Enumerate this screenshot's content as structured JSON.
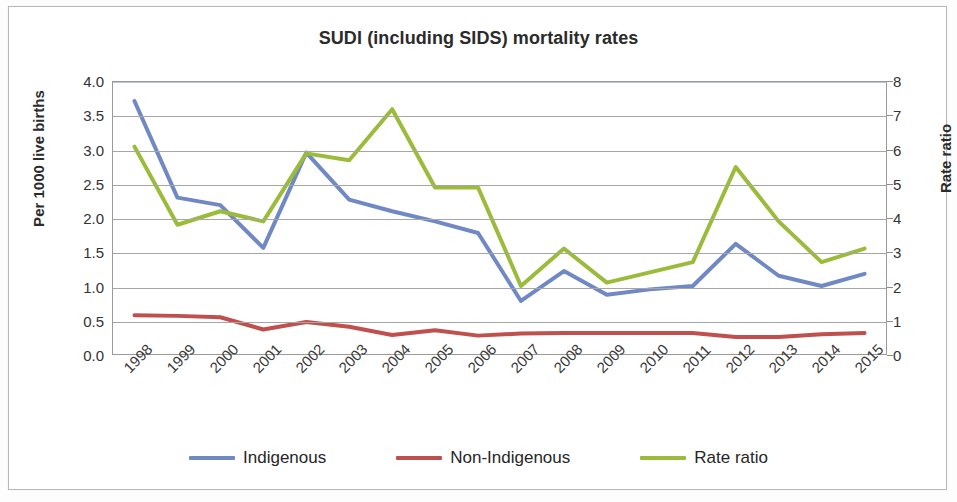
{
  "chart_data": {
    "type": "line",
    "title": "SUDI (including SIDS) mortality rates",
    "xlabel": "",
    "ylabel": "Per 1000 live births",
    "y2label": "Rate ratio",
    "ylim": [
      0,
      4
    ],
    "y2lim": [
      0,
      8
    ],
    "ytick_labels": [
      "4.0",
      "3.5",
      "3.0",
      "2.5",
      "2.0",
      "1.5",
      "1.0",
      "0.5",
      "0.0"
    ],
    "ytick_values": [
      4.0,
      3.5,
      3.0,
      2.5,
      2.0,
      1.5,
      1.0,
      0.5,
      0.0
    ],
    "y2tick_labels": [
      "8",
      "7",
      "6",
      "5",
      "4",
      "3",
      "2",
      "1",
      "0"
    ],
    "y2tick_values": [
      8,
      7,
      6,
      5,
      4,
      3,
      2,
      1,
      0
    ],
    "grid": true,
    "legend_position": "bottom",
    "categories": [
      "1998",
      "1999",
      "2000",
      "2001",
      "2002",
      "2003",
      "2004",
      "2005",
      "2006",
      "2007",
      "2008",
      "2009",
      "2010",
      "2011",
      "2012",
      "2013",
      "2014",
      "2015"
    ],
    "series": [
      {
        "name": "Indigenous",
        "axis": "left",
        "color": "#7089c4",
        "values": [
          3.72,
          2.3,
          2.19,
          1.56,
          2.96,
          2.27,
          2.1,
          1.95,
          1.78,
          0.78,
          1.22,
          0.87,
          0.95,
          1.0,
          1.62,
          1.15,
          1.0,
          1.18
        ]
      },
      {
        "name": "Non-Indigenous",
        "axis": "left",
        "color": "#c0504d",
        "values": [
          0.57,
          0.56,
          0.54,
          0.36,
          0.47,
          0.4,
          0.28,
          0.35,
          0.27,
          0.3,
          0.31,
          0.31,
          0.31,
          0.31,
          0.25,
          0.25,
          0.29,
          0.31
        ]
      },
      {
        "name": "Rate ratio",
        "axis": "right",
        "color": "#9bbb3a",
        "values": [
          6.1,
          3.8,
          4.2,
          3.9,
          5.9,
          5.7,
          7.2,
          4.9,
          4.9,
          2.0,
          3.1,
          2.1,
          2.4,
          2.7,
          5.5,
          3.9,
          2.7,
          3.1
        ]
      }
    ]
  },
  "axes": {
    "left_title": "Per 1000 live births",
    "right_title": "Rate ratio"
  },
  "legend": {
    "items": [
      {
        "label": "Indigenous",
        "color": "#7089c4"
      },
      {
        "label": "Non-Indigenous",
        "color": "#c0504d"
      },
      {
        "label": "Rate ratio",
        "color": "#9bbb3a"
      }
    ]
  }
}
